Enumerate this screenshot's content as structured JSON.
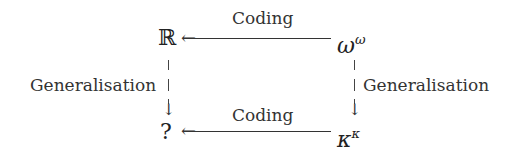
{
  "diagram": {
    "nodes": {
      "top_left": "ℝ",
      "top_right_base": "ω",
      "top_right_sup": "ω",
      "bottom_left": "?",
      "bottom_right_base": "κ",
      "bottom_right_sup": "κ"
    },
    "edges": {
      "top": {
        "label": "Coding",
        "from": "ω^ω",
        "to": "ℝ"
      },
      "bottom": {
        "label": "Coding",
        "from": "κ^κ",
        "to": "?"
      },
      "left": {
        "label": "Generalisation",
        "from": "ℝ",
        "to": "?"
      },
      "right": {
        "label": "Generalisation",
        "from": "ω^ω",
        "to": "κ^κ"
      }
    },
    "arrow_glyph_left": "←",
    "arrow_glyph_down": "↓"
  }
}
